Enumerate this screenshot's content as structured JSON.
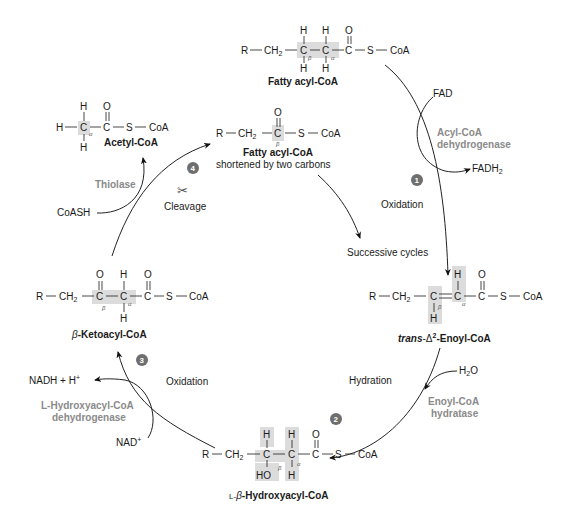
{
  "molecules": {
    "fatty_acyl_coa": {
      "name": "Fatty acyl-CoA",
      "formula": [
        "R",
        "CH2",
        "C",
        "C",
        "C",
        "S",
        "CoA"
      ],
      "labels": [
        "β",
        "α"
      ]
    },
    "enoyl_coa": {
      "name_prefix": "trans",
      "name_delta": "-Δ",
      "name_sup": "2",
      "name_suffix": "-Enoyl-CoA",
      "labels": [
        "β",
        "α"
      ]
    },
    "hydroxyacyl_coa": {
      "name_prefix": "L-",
      "name_beta": "β",
      "name_suffix": "-Hydroxyacyl-CoA",
      "labels": [
        "β",
        "α"
      ],
      "group": "HO"
    },
    "ketoacyl_coa": {
      "name_beta": "β",
      "name_suffix": "-Ketoacyl-CoA",
      "labels": [
        "β",
        "α"
      ]
    },
    "shortened_acyl_coa": {
      "name": "Fatty acyl-CoA",
      "subtitle": "shortened by  two carbons",
      "labels": [
        "β"
      ]
    },
    "acetyl_coa": {
      "name": "Acetyl-CoA",
      "labels": [
        "α"
      ]
    }
  },
  "steps": [
    {
      "number": "1",
      "process": "Oxidation",
      "enzyme_line1": "Acyl-CoA",
      "enzyme_line2": "dehydrogenase",
      "input": "FAD",
      "output_main": "FADH",
      "output_sub": "2"
    },
    {
      "number": "2",
      "process": "Hydration",
      "enzyme_line1": "Enoyl-CoA",
      "enzyme_line2": "hydratase",
      "input_main": "H",
      "input_sub": "2",
      "input_end": "O"
    },
    {
      "number": "3",
      "process": "Oxidation",
      "enzyme_line1": "L-Hydroxyacyl-CoA",
      "enzyme_line2": "dehydrogenase",
      "input_main": "NAD",
      "input_sup": "+",
      "output": "NADH + H",
      "output_sup": "+"
    },
    {
      "number": "4",
      "process": "Cleavage",
      "enzyme_line1": "Thiolase",
      "input": "CoASH",
      "icon": "scissors-icon"
    }
  ],
  "cycle_label": "Successive cycles",
  "atoms": {
    "R": "R",
    "CH2": "CH",
    "two": "2",
    "C": "C",
    "S": "S",
    "CoA": "CoA",
    "H": "H",
    "O": "O",
    "dash": "—"
  },
  "colors": {
    "highlight": "#dcdcdc",
    "enzyme": "#8a8a8a",
    "step_badge": "#6e6e6e",
    "text": "#1a1a1a"
  }
}
